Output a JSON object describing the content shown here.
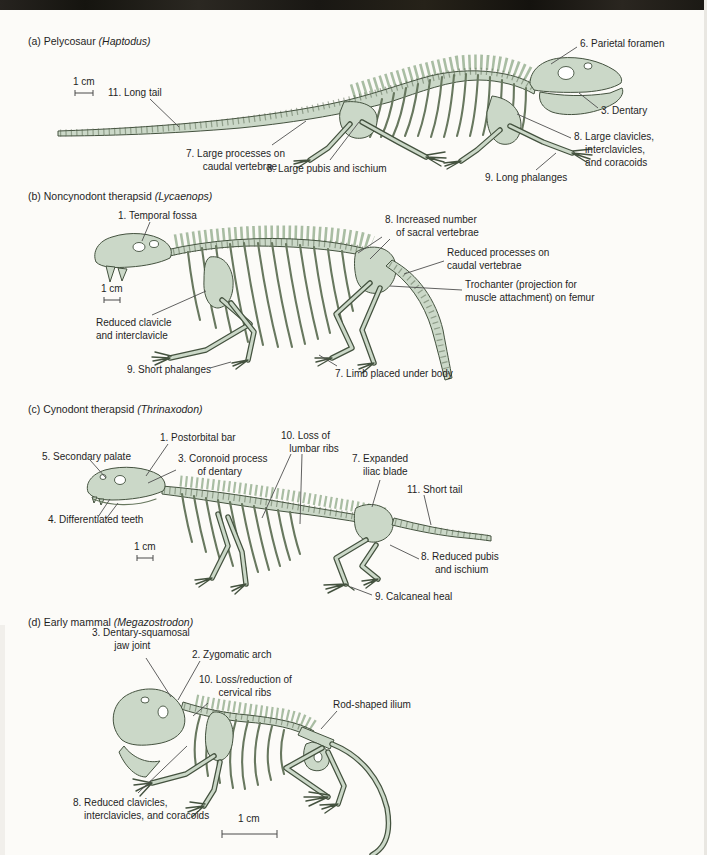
{
  "colors": {
    "page_bg": "#fcfbf8",
    "text": "#1f1f1f",
    "leader": "#4f4f4f",
    "skel_fill": "#cbd8c8",
    "skel_outline": "#44523f",
    "skel_mid": "#68785f",
    "skel_seg": "#53634b",
    "skel_spines": "#a9bda3"
  },
  "panels": [
    {
      "caption": "(a) Pelycosaur",
      "genus": " (Haptodus)",
      "scale": "1 cm",
      "labels": {
        "parietal_foramen": "6. Parietal foramen",
        "long_tail": "11. Long tail",
        "caudal_processes": "7. Large processes on\n      caudal vertebrae",
        "pubis_ischium": "8. Large pubis and ischium",
        "long_phalanges": "9. Long phalanges",
        "dentary": "3. Dentary",
        "clavicles": "8. Large clavicles,\n    interclavicles,\n    and coracoids"
      }
    },
    {
      "caption": "(b) Noncynodont therapsid",
      "genus": " (Lycaenops)",
      "scale": "1 cm",
      "labels": {
        "temporal_fossa": "1. Temporal fossa",
        "sacral_vertebrae": "8. Increased number\n    of sacral vertebrae",
        "reduced_caudal": "Reduced processes on\ncaudal vertebrae",
        "trochanter": "Trochanter (projection for\nmuscle attachment) on femur",
        "reduced_clavicle": "Reduced clavicle\nand interclavicle",
        "short_phalanges": "9. Short phalanges",
        "limb_under_body": "7. Limb placed under body"
      }
    },
    {
      "caption": "(c) Cynodont therapsid",
      "genus": " (Thrinaxodon)",
      "scale": "1 cm",
      "labels": {
        "postorbital_bar": "1. Postorbital bar",
        "secondary_palate": "5. Secondary palate",
        "coronoid_process": "3. Coronoid process\n       of dentary",
        "lumbar_ribs": "10. Loss of\n   lumbar ribs",
        "iliac_blade": "7. Expanded\n    iliac blade",
        "short_tail": "11. Short tail",
        "differentiated_teeth": "4. Differentiated teeth",
        "reduced_pubis": "8. Reduced pubis\n     and ischium",
        "calcaneal_heel": "9. Calcaneal heal"
      }
    },
    {
      "caption": "(d) Early mammal",
      "genus": " (Megazostrodon)",
      "scale": "1 cm",
      "labels": {
        "jaw_joint": "3. Dentary-squamosal\n        jaw joint",
        "zygomatic_arch": "2. Zygomatic arch",
        "cervical_ribs": "10. Loss/reduction of\n       cervical ribs",
        "rod_ilium": "Rod-shaped ilium",
        "reduced_clavicles": "8. Reduced clavicles,\n    interclavicles, and coracoids"
      }
    }
  ]
}
